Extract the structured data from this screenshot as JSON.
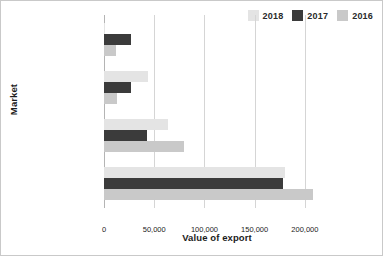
{
  "chart_data": {
    "type": "bar",
    "orientation": "horizontal",
    "title": "",
    "xlabel": "Value of export",
    "ylabel": "Market",
    "categories": [
      "New Caledonia",
      "Fiji",
      "China",
      "United States"
    ],
    "series": [
      {
        "name": "2018",
        "color": "#e4e4e4",
        "values": [
          1000,
          44000,
          64000,
          180000
        ]
      },
      {
        "name": "2017",
        "color": "#3b3b3b",
        "values": [
          27000,
          27000,
          43000,
          178000
        ]
      },
      {
        "name": "2016",
        "color": "#c9c9c9",
        "values": [
          12000,
          13000,
          80000,
          208000
        ]
      }
    ],
    "xticks": [
      0,
      50000,
      100000,
      150000,
      200000
    ],
    "xtick_labels": [
      "0",
      "50,000",
      "100,000",
      "150,000",
      "200,000"
    ],
    "xlim": [
      0,
      225000
    ],
    "grid": "vertical",
    "legend_position": "top-right",
    "legend_order": [
      "2018",
      "2017",
      "2016"
    ]
  }
}
